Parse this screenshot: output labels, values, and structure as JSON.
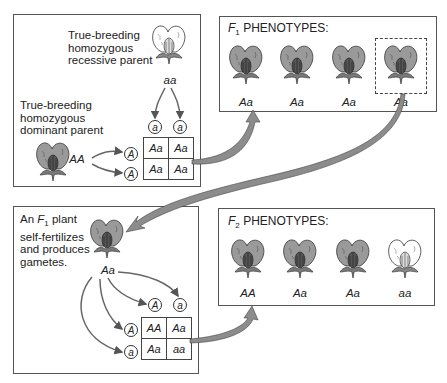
{
  "panel_parental": {
    "recessive_parent_label": "True-breeding\nhomozygous\nrecessive parent",
    "recessive_genotype": "aa",
    "dominant_parent_label": "True-breeding\nhomozygous\ndominant parent",
    "dominant_genotype": "AA",
    "gametes_top": [
      "a",
      "a"
    ],
    "gametes_left": [
      "A",
      "A"
    ],
    "punnett": [
      [
        "Aa",
        "Aa"
      ],
      [
        "Aa",
        "Aa"
      ]
    ]
  },
  "panel_f1": {
    "title_letter": "F",
    "title_sub": "1",
    "title_rest": " PHENOTYPES:",
    "plants": [
      {
        "genotype": "Aa",
        "color": "purple",
        "highlighted": false
      },
      {
        "genotype": "Aa",
        "color": "purple",
        "highlighted": false
      },
      {
        "genotype": "Aa",
        "color": "purple",
        "highlighted": false
      },
      {
        "genotype": "Aa",
        "color": "purple",
        "highlighted": true
      }
    ]
  },
  "panel_selfing": {
    "label_pre": "An ",
    "label_f": "F",
    "label_sub": "1",
    "label_post": " plant\nself-fertilizes\nand produces\ngametes.",
    "genotype": "Aa",
    "gametes_top": [
      "A",
      "a"
    ],
    "gametes_left": [
      "A",
      "a"
    ],
    "punnett": [
      [
        "AA",
        "Aa"
      ],
      [
        "Aa",
        "aa"
      ]
    ]
  },
  "panel_f2": {
    "title_letter": "F",
    "title_sub": "2",
    "title_rest": " PHENOTYPES:",
    "plants": [
      {
        "genotype": "AA",
        "color": "purple"
      },
      {
        "genotype": "Aa",
        "color": "purple"
      },
      {
        "genotype": "Aa",
        "color": "purple"
      },
      {
        "genotype": "aa",
        "color": "white"
      }
    ]
  },
  "colors": {
    "dominant_flower": "#9a9a9a",
    "recessive_flower": "#ffffff",
    "arrow_fill": "#8c8c8c",
    "border": "#555555"
  }
}
